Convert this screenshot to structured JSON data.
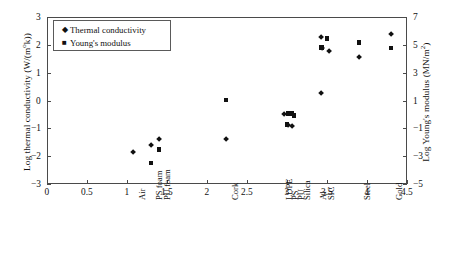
{
  "chart_data": {
    "type": "scatter",
    "title": "",
    "xlabel": "",
    "ylabel": "Log thermal conductivity (W/(m°k))",
    "ylabel_right": "Log Young's modulus (MN/m²)",
    "xlim": [
      0,
      4.5
    ],
    "ylim": [
      -3,
      3
    ],
    "ylim_right": [
      -5,
      7
    ],
    "grid": false,
    "legend_position": "top-left",
    "xticks": [
      "0",
      "0.5",
      "1",
      "1.5",
      "2",
      "2.5",
      "3",
      "3.5",
      "4",
      "4.5"
    ],
    "xtick_values": [
      0,
      0.5,
      1,
      1.5,
      2,
      2.5,
      3,
      3.5,
      4,
      4.5
    ],
    "yticks": [
      "3",
      "2",
      "1",
      "0",
      "−1",
      "−2",
      "−3"
    ],
    "ytick_values": [
      3,
      2,
      1,
      0,
      -1,
      -2,
      -3
    ],
    "yticks_right": [
      "7",
      "5",
      "3",
      "1",
      "−1",
      "−3",
      "−5"
    ],
    "ytick_values_right": [
      7,
      5,
      3,
      1,
      -1,
      -3,
      -5
    ],
    "material_labels": [
      {
        "name": "Air",
        "x": 1.08
      },
      {
        "name": "PS foam",
        "x": 1.3
      },
      {
        "name": "PU foam",
        "x": 1.4
      },
      {
        "name": "Cork",
        "x": 2.24
      },
      {
        "name": "LDPE",
        "x": 2.92
      },
      {
        "name": "PS",
        "x": 3.0
      },
      {
        "name": "PU",
        "x": 3.07
      },
      {
        "name": "Silica",
        "x": 3.15
      },
      {
        "name": "Al",
        "x": 3.35
      },
      {
        "name": "SIC",
        "x": 3.45
      },
      {
        "name": "Steel",
        "x": 3.9
      },
      {
        "name": "Gold",
        "x": 4.3
      }
    ],
    "series": [
      {
        "name": "Thermal conductivity",
        "marker": "diamond",
        "color": "#111111",
        "points": [
          {
            "x": 1.08,
            "y": -1.87
          },
          {
            "x": 1.3,
            "y": -1.6
          },
          {
            "x": 1.4,
            "y": -1.38
          },
          {
            "x": 2.24,
            "y": -1.4
          },
          {
            "x": 2.96,
            "y": -0.5
          },
          {
            "x": 3.01,
            "y": -0.88
          },
          {
            "x": 3.06,
            "y": -0.93
          },
          {
            "x": 3.42,
            "y": 2.28
          },
          {
            "x": 3.44,
            "y": 1.88
          },
          {
            "x": 3.52,
            "y": 1.78
          },
          {
            "x": 3.42,
            "y": 0.25
          },
          {
            "x": 3.9,
            "y": 1.57
          },
          {
            "x": 4.3,
            "y": 2.38
          }
        ]
      },
      {
        "name": "Young's modulus",
        "marker": "square",
        "color": "#111111",
        "points": [
          {
            "x": 1.3,
            "y": -2.25
          },
          {
            "x": 1.4,
            "y": -1.75
          },
          {
            "x": 2.24,
            "y": 0.02
          },
          {
            "x": 3.02,
            "y": -0.47
          },
          {
            "x": 3.06,
            "y": -0.46
          },
          {
            "x": 3.09,
            "y": -0.53
          },
          {
            "x": 3.0,
            "y": -0.86
          },
          {
            "x": 3.43,
            "y": 1.9
          },
          {
            "x": 3.5,
            "y": 2.23
          },
          {
            "x": 3.9,
            "y": 2.08
          },
          {
            "x": 4.3,
            "y": 1.88
          }
        ]
      }
    ]
  },
  "legend": {
    "items": [
      {
        "label": "Thermal conductivity",
        "symbol": "◆"
      },
      {
        "label": "Young's modulus",
        "symbol": "■"
      }
    ]
  },
  "axis": {
    "left_title_main": "Log thermal conductivity (W/(m",
    "left_title_sup": "o",
    "left_title_tail": "k))",
    "right_title_main": "Log Young's modulus (MN/m",
    "right_title_sup": "2",
    "right_title_tail": ")"
  }
}
